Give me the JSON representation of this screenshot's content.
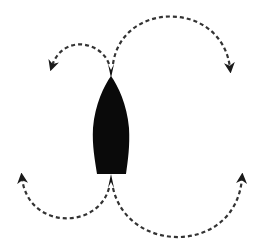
{
  "diagram": {
    "description": "Top view of a boat hull with four dashed curved arrows indicating turning paths from bow and stern",
    "colors": {
      "background": "#ffffff",
      "hull": "#0a0a0a",
      "arrows": "#333333"
    },
    "arrows": [
      {
        "id": "bow-left",
        "from": "bow",
        "direction": "left"
      },
      {
        "id": "bow-right",
        "from": "bow",
        "direction": "right"
      },
      {
        "id": "stern-left",
        "from": "stern",
        "direction": "left"
      },
      {
        "id": "stern-right",
        "from": "stern",
        "direction": "right"
      }
    ]
  }
}
